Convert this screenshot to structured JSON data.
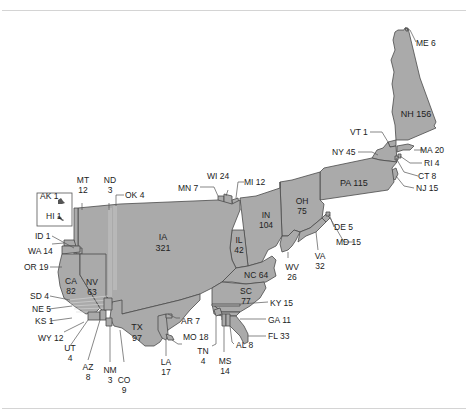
{
  "figure": {
    "type": "cartogram",
    "fill_color": "#aaaaaa",
    "border_color": "#4a4a4a",
    "rule_color": "#d4d4d4"
  },
  "states": {
    "ME": {
      "abbr": "ME",
      "value": "6"
    },
    "NH": {
      "abbr": "NH",
      "value": "156"
    },
    "VT": {
      "abbr": "VT",
      "value": "1"
    },
    "NY": {
      "abbr": "NY",
      "value": "45"
    },
    "MA": {
      "abbr": "MA",
      "value": "20"
    },
    "RI": {
      "abbr": "RI",
      "value": "4"
    },
    "CT": {
      "abbr": "CT",
      "value": "8"
    },
    "NJ": {
      "abbr": "NJ",
      "value": "15"
    },
    "PA": {
      "abbr": "PA",
      "value": "115"
    },
    "OH": {
      "abbr": "OH",
      "value": "75"
    },
    "IN": {
      "abbr": "IN",
      "value": "104"
    },
    "IL": {
      "abbr": "IL",
      "value": "42"
    },
    "MI": {
      "abbr": "MI",
      "value": "12"
    },
    "WI": {
      "abbr": "WI",
      "value": "24"
    },
    "MN": {
      "abbr": "MN",
      "value": "7"
    },
    "IA": {
      "abbr": "IA",
      "value": "321"
    },
    "MT": {
      "abbr": "MT",
      "value": "12"
    },
    "ND": {
      "abbr": "ND",
      "value": "3"
    },
    "OK": {
      "abbr": "OK",
      "value": "4"
    },
    "AK": {
      "abbr": "AK",
      "value": "1"
    },
    "HI": {
      "abbr": "HI",
      "value": "1"
    },
    "ID": {
      "abbr": "ID",
      "value": "1"
    },
    "WA": {
      "abbr": "WA",
      "value": "14"
    },
    "OR": {
      "abbr": "OR",
      "value": "19"
    },
    "CA": {
      "abbr": "CA",
      "value": "82"
    },
    "NV": {
      "abbr": "NV",
      "value": "63"
    },
    "SD": {
      "abbr": "SD",
      "value": "4"
    },
    "NE": {
      "abbr": "NE",
      "value": "5"
    },
    "KS": {
      "abbr": "KS",
      "value": "1"
    },
    "WY": {
      "abbr": "WY",
      "value": "12"
    },
    "UT": {
      "abbr": "UT",
      "value": "4"
    },
    "AZ": {
      "abbr": "AZ",
      "value": "8"
    },
    "NM": {
      "abbr": "NM",
      "value": "3"
    },
    "CO": {
      "abbr": "CO",
      "value": "9"
    },
    "TX": {
      "abbr": "TX",
      "value": "97"
    },
    "LA": {
      "abbr": "LA",
      "value": "17"
    },
    "AR": {
      "abbr": "AR",
      "value": "7"
    },
    "MO": {
      "abbr": "MO",
      "value": "18"
    },
    "TN": {
      "abbr": "TN",
      "value": "4"
    },
    "MS": {
      "abbr": "MS",
      "value": "14"
    },
    "AL": {
      "abbr": "AL",
      "value": "8"
    },
    "FL": {
      "abbr": "FL",
      "value": "33"
    },
    "GA": {
      "abbr": "GA",
      "value": "11"
    },
    "KY": {
      "abbr": "KY",
      "value": "15"
    },
    "SC": {
      "abbr": "SC",
      "value": "77"
    },
    "NC": {
      "abbr": "NC",
      "value": "64"
    },
    "WV": {
      "abbr": "WV",
      "value": "26"
    },
    "VA": {
      "abbr": "VA",
      "value": "32"
    },
    "MD": {
      "abbr": "MD",
      "value": "15"
    },
    "DE": {
      "abbr": "DE",
      "value": "5"
    }
  },
  "labels": {
    "ME": "ME 6",
    "VT": "VT 1",
    "NY": "NY 45",
    "MA": "MA 20",
    "RI": "RI 4",
    "CT": "CT 8",
    "NJ": "NJ 15",
    "MI": "MI 12",
    "WI": "WI 24",
    "MN": "MN 7",
    "OK": "OK 4",
    "AK": "AK 1",
    "HI": "HI 1",
    "ID": "ID 1",
    "WA": "WA 14",
    "OR": "OR 19",
    "SD": "SD 4",
    "NE": "NE 5",
    "KS": "KS 1",
    "WY": "WY 12",
    "AR": "AR 7",
    "MO": "MO 18",
    "AL": "AL 8",
    "FL": "FL 33",
    "GA": "GA 11",
    "KY": "KY 15",
    "MD": "MD 15",
    "DE": "DE 5"
  }
}
